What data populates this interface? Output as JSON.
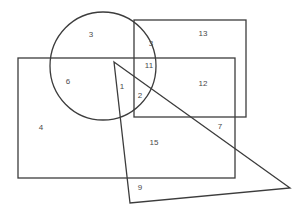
{
  "diagram": {
    "type": "venn-style overlapping shapes",
    "shapes": {
      "circle": {
        "cx": 103,
        "cy": 66,
        "rx": 53,
        "ry": 54
      },
      "top_right_rectangle": {
        "x": 134,
        "y": 20,
        "width": 112,
        "height": 97
      },
      "large_rectangle": {
        "x": 18,
        "y": 58,
        "width": 217,
        "height": 120
      },
      "triangle": {
        "points": "114,62 290,188 130,203"
      }
    },
    "regions": [
      {
        "label": "3",
        "x": 91,
        "y": 37
      },
      {
        "label": "3",
        "x": 151,
        "y": 46
      },
      {
        "label": "13",
        "x": 203,
        "y": 36
      },
      {
        "label": "11",
        "x": 149,
        "y": 68
      },
      {
        "label": "6",
        "x": 68,
        "y": 84
      },
      {
        "label": "1",
        "x": 122,
        "y": 89
      },
      {
        "label": "2",
        "x": 140,
        "y": 98
      },
      {
        "label": "12",
        "x": 203,
        "y": 86
      },
      {
        "label": "4",
        "x": 41,
        "y": 130
      },
      {
        "label": "7",
        "x": 220,
        "y": 129
      },
      {
        "label": "15",
        "x": 154,
        "y": 145
      },
      {
        "label": "9",
        "x": 140,
        "y": 190
      }
    ]
  }
}
